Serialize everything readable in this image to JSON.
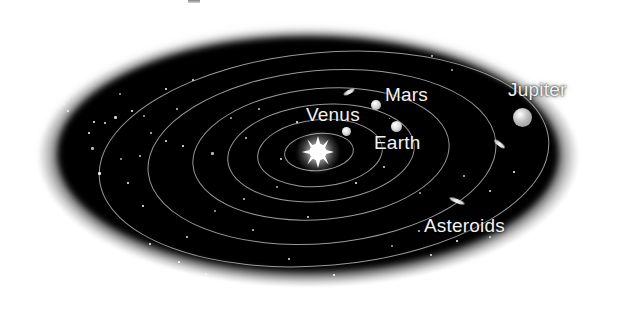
{
  "figure": {
    "kind": "solar-system-diagram",
    "background_color": "#ffffff",
    "space_color": "#000000",
    "orbit_color": "#bababa",
    "label_color": "#f2f2f2",
    "crop_remnant_visible": true
  },
  "labels": {
    "venus": "Venus",
    "earth": "Earth",
    "mars": "Mars",
    "jupiter": "Jupiter",
    "asteroids": "Asteroids"
  },
  "sun": {
    "name": "Sun",
    "cx": 318,
    "cy": 152,
    "color": "#ffffff",
    "points": 8,
    "radius": 16
  },
  "orbits": [
    {
      "name": "mercury-orbit",
      "left": 284,
      "top": 133,
      "width": 70,
      "height": 38
    },
    {
      "name": "venus-orbit",
      "left": 257,
      "top": 119,
      "width": 126,
      "height": 68
    },
    {
      "name": "earth-orbit",
      "left": 227,
      "top": 104,
      "width": 188,
      "height": 98
    },
    {
      "name": "mars-orbit",
      "left": 192,
      "top": 88,
      "width": 258,
      "height": 132
    },
    {
      "name": "asteroid-belt-orbit",
      "left": 147,
      "top": 70,
      "width": 350,
      "height": 174
    },
    {
      "name": "jupiter-orbit",
      "left": 98,
      "top": 52,
      "width": 452,
      "height": 214
    }
  ],
  "planets": [
    {
      "name": "venus",
      "label": "Venus",
      "cx": 346,
      "cy": 131,
      "r": 4.5,
      "color": "#d8d8d8"
    },
    {
      "name": "earth",
      "label": "Earth",
      "cx": 396,
      "cy": 126,
      "r": 5.5,
      "color": "#dedede"
    },
    {
      "name": "mars",
      "label": "Mars",
      "cx": 376,
      "cy": 105,
      "r": 5.0,
      "color": "#d4d4d4"
    },
    {
      "name": "jupiter",
      "label": "Jupiter",
      "cx": 522,
      "cy": 117,
      "r": 9.5,
      "color": "#b9b9b9"
    }
  ],
  "asteroid_streaks": [
    {
      "name": "asteroid-streak-top",
      "cx": 349,
      "cy": 92,
      "len": 12,
      "thick": 4,
      "angle": -28
    },
    {
      "name": "asteroid-streak-right",
      "cx": 499,
      "cy": 144,
      "len": 13,
      "thick": 4,
      "angle": 38
    },
    {
      "name": "asteroid-streak-bottom",
      "cx": 457,
      "cy": 201,
      "len": 16,
      "thick": 4,
      "angle": 22
    }
  ],
  "stars": [
    {
      "x": 104,
      "y": 51,
      "s": 3
    },
    {
      "x": 82,
      "y": 79,
      "s": 3
    },
    {
      "x": 36,
      "y": 82,
      "s": 3
    },
    {
      "x": 44,
      "y": 92,
      "s": 2
    },
    {
      "x": 60,
      "y": 90,
      "s": 3
    },
    {
      "x": 63,
      "y": 103,
      "s": 2
    },
    {
      "x": 67,
      "y": 110,
      "s": 2
    },
    {
      "x": 131,
      "y": 110,
      "s": 2
    },
    {
      "x": 143,
      "y": 115,
      "s": 2
    },
    {
      "x": 114,
      "y": 116,
      "s": 3
    },
    {
      "x": 104,
      "y": 122,
      "s": 2
    },
    {
      "x": 93,
      "y": 121,
      "s": 2
    },
    {
      "x": 119,
      "y": 93,
      "s": 2
    },
    {
      "x": 176,
      "y": 108,
      "s": 2
    },
    {
      "x": 40,
      "y": 121,
      "s": 3
    },
    {
      "x": 88,
      "y": 132,
      "s": 2
    },
    {
      "x": 91,
      "y": 147,
      "s": 3
    },
    {
      "x": 150,
      "y": 132,
      "s": 2
    },
    {
      "x": 165,
      "y": 140,
      "s": 2
    },
    {
      "x": 182,
      "y": 145,
      "s": 2
    },
    {
      "x": 120,
      "y": 158,
      "s": 2
    },
    {
      "x": 139,
      "y": 155,
      "s": 2
    },
    {
      "x": 98,
      "y": 172,
      "s": 3
    },
    {
      "x": 127,
      "y": 182,
      "s": 2
    },
    {
      "x": 211,
      "y": 152,
      "s": 3
    },
    {
      "x": 245,
      "y": 137,
      "s": 2
    },
    {
      "x": 280,
      "y": 158,
      "s": 2
    },
    {
      "x": 296,
      "y": 121,
      "s": 2
    },
    {
      "x": 230,
      "y": 117,
      "s": 2
    },
    {
      "x": 258,
      "y": 108,
      "s": 2
    },
    {
      "x": 192,
      "y": 79,
      "s": 2
    },
    {
      "x": 165,
      "y": 88,
      "s": 2
    },
    {
      "x": 214,
      "y": 210,
      "s": 2
    },
    {
      "x": 252,
      "y": 229,
      "s": 2
    },
    {
      "x": 186,
      "y": 236,
      "s": 2
    },
    {
      "x": 142,
      "y": 205,
      "s": 2
    },
    {
      "x": 205,
      "y": 273,
      "s": 2
    },
    {
      "x": 248,
      "y": 285,
      "s": 2
    },
    {
      "x": 288,
      "y": 258,
      "s": 2
    },
    {
      "x": 333,
      "y": 274,
      "s": 2
    },
    {
      "x": 348,
      "y": 296,
      "s": 2
    },
    {
      "x": 371,
      "y": 287,
      "s": 2
    },
    {
      "x": 313,
      "y": 300,
      "s": 2
    },
    {
      "x": 178,
      "y": 261,
      "s": 2
    },
    {
      "x": 391,
      "y": 245,
      "s": 2
    },
    {
      "x": 418,
      "y": 230,
      "s": 2
    },
    {
      "x": 430,
      "y": 254,
      "s": 2
    },
    {
      "x": 456,
      "y": 240,
      "s": 2
    },
    {
      "x": 471,
      "y": 258,
      "s": 2
    },
    {
      "x": 489,
      "y": 236,
      "s": 2
    },
    {
      "x": 507,
      "y": 253,
      "s": 2
    },
    {
      "x": 528,
      "y": 240,
      "s": 2
    },
    {
      "x": 553,
      "y": 226,
      "s": 2
    },
    {
      "x": 569,
      "y": 246,
      "s": 2
    },
    {
      "x": 566,
      "y": 203,
      "s": 2
    },
    {
      "x": 576,
      "y": 181,
      "s": 2
    },
    {
      "x": 582,
      "y": 154,
      "s": 2
    },
    {
      "x": 571,
      "y": 128,
      "s": 2
    },
    {
      "x": 555,
      "y": 96,
      "s": 2
    },
    {
      "x": 540,
      "y": 72,
      "s": 2
    },
    {
      "x": 451,
      "y": 69,
      "s": 2
    },
    {
      "x": 431,
      "y": 55,
      "s": 2
    },
    {
      "x": 383,
      "y": 166,
      "s": 2
    },
    {
      "x": 355,
      "y": 182,
      "s": 2
    },
    {
      "x": 419,
      "y": 192,
      "s": 2
    },
    {
      "x": 463,
      "y": 175,
      "s": 2
    },
    {
      "x": 489,
      "y": 190,
      "s": 2
    },
    {
      "x": 513,
      "y": 171,
      "s": 2
    },
    {
      "x": 276,
      "y": 186,
      "s": 2
    },
    {
      "x": 243,
      "y": 198,
      "s": 2
    },
    {
      "x": 307,
      "y": 216,
      "s": 2
    },
    {
      "x": 149,
      "y": 243,
      "s": 2
    },
    {
      "x": 389,
      "y": 118,
      "s": 1
    }
  ]
}
